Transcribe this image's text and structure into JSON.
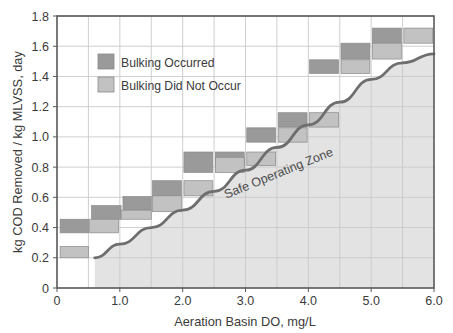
{
  "chart_data": {
    "type": "bar",
    "title": "",
    "xlabel": "Aeration Basin DO, mg/L",
    "ylabel": "kg COD Removed / kg MLVSS, day",
    "xlim": [
      0,
      6.0
    ],
    "ylim": [
      0,
      1.8
    ],
    "xticks": [
      "0",
      "1.0",
      "2.0",
      "3.0",
      "4.0",
      "5.0",
      "6.0"
    ],
    "xtick_values": [
      0,
      1.0,
      2.0,
      3.0,
      4.0,
      5.0,
      6.0
    ],
    "yticks": [
      "0",
      "0.2",
      "0.4",
      "0.6",
      "0.8",
      "1.0",
      "1.2",
      "1.4",
      "1.6",
      "1.8"
    ],
    "ytick_values": [
      0,
      0.2,
      0.4,
      0.6,
      0.8,
      1.0,
      1.2,
      1.4,
      1.6,
      1.8
    ],
    "grid": true,
    "minor_grid_x_step": 0.5,
    "legend_position": "upper-left-inside",
    "series": [
      {
        "name": "Bulking Occurred",
        "color": "#9a9a9a",
        "bars": [
          {
            "x0": 0.05,
            "x1": 0.5,
            "y0": 0.365,
            "y1": 0.455
          },
          {
            "x0": 0.55,
            "x1": 1.02,
            "y0": 0.455,
            "y1": 0.545
          },
          {
            "x0": 1.05,
            "x1": 1.5,
            "y0": 0.515,
            "y1": 0.605
          },
          {
            "x0": 1.52,
            "x1": 1.98,
            "y0": 0.61,
            "y1": 0.71
          },
          {
            "x0": 2.02,
            "x1": 2.48,
            "y0": 0.765,
            "y1": 0.9
          },
          {
            "x0": 2.52,
            "x1": 2.98,
            "y0": 0.81,
            "y1": 0.9
          },
          {
            "x0": 3.02,
            "x1": 3.48,
            "y0": 0.965,
            "y1": 1.06
          },
          {
            "x0": 3.52,
            "x1": 3.98,
            "y0": 1.065,
            "y1": 1.16
          },
          {
            "x0": 4.02,
            "x1": 4.48,
            "y0": 1.42,
            "y1": 1.51
          },
          {
            "x0": 4.52,
            "x1": 4.98,
            "y0": 1.515,
            "y1": 1.62
          },
          {
            "x0": 5.02,
            "x1": 5.48,
            "y0": 1.62,
            "y1": 1.72
          }
        ]
      },
      {
        "name": "Bulking Did Not Occur",
        "color": "#c2c2c2",
        "bars": [
          {
            "x0": 0.05,
            "x1": 0.5,
            "y0": 0.2,
            "y1": 0.275
          },
          {
            "x0": 0.52,
            "x1": 0.98,
            "y0": 0.365,
            "y1": 0.455
          },
          {
            "x0": 1.02,
            "x1": 1.5,
            "y0": 0.455,
            "y1": 0.515
          },
          {
            "x0": 1.52,
            "x1": 1.98,
            "y0": 0.505,
            "y1": 0.61
          },
          {
            "x0": 2.02,
            "x1": 2.48,
            "y0": 0.61,
            "y1": 0.71
          },
          {
            "x0": 2.52,
            "x1": 2.98,
            "y0": 0.765,
            "y1": 0.865
          },
          {
            "x0": 3.02,
            "x1": 3.48,
            "y0": 0.81,
            "y1": 0.9
          },
          {
            "x0": 3.52,
            "x1": 3.98,
            "y0": 0.965,
            "y1": 1.06
          },
          {
            "x0": 4.02,
            "x1": 4.48,
            "y0": 1.065,
            "y1": 1.16
          },
          {
            "x0": 4.52,
            "x1": 4.98,
            "y0": 1.42,
            "y1": 1.51
          },
          {
            "x0": 5.02,
            "x1": 5.48,
            "y0": 1.515,
            "y1": 1.62
          },
          {
            "x0": 5.52,
            "x1": 5.98,
            "y0": 1.62,
            "y1": 1.72
          }
        ]
      }
    ],
    "boundary_curve": {
      "name": "Safe Operating Zone boundary",
      "color": "#6e6e6e",
      "points": [
        {
          "x": 0.6,
          "y": 0.2
        },
        {
          "x": 1.0,
          "y": 0.29
        },
        {
          "x": 1.5,
          "y": 0.4
        },
        {
          "x": 2.0,
          "y": 0.515
        },
        {
          "x": 2.5,
          "y": 0.64
        },
        {
          "x": 3.0,
          "y": 0.78
        },
        {
          "x": 3.5,
          "y": 0.93
        },
        {
          "x": 4.0,
          "y": 1.08
        },
        {
          "x": 4.5,
          "y": 1.23
        },
        {
          "x": 5.0,
          "y": 1.38
        },
        {
          "x": 5.5,
          "y": 1.49
        },
        {
          "x": 6.0,
          "y": 1.55
        }
      ]
    },
    "shaded_region": {
      "label": "Safe Operating Zone",
      "color": "#e3e3e3"
    },
    "annotations": [
      {
        "text": "Safe Operating Zone",
        "x": 3.55,
        "y": 0.735,
        "rotation": -22
      }
    ]
  },
  "legend": {
    "items": [
      {
        "label": "Bulking Occurred",
        "color": "#9a9a9a"
      },
      {
        "label": "Bulking Did Not Occur",
        "color": "#c2c2c2"
      }
    ]
  },
  "axes": {
    "x_title": "Aeration Basin DO, mg/L",
    "y_title": "kg COD Removed / kg MLVSS, day"
  },
  "style": {
    "plot_border": "#595959",
    "grid_line": "#c9c9c9",
    "bar_dark": "#9a9a9a",
    "bar_light": "#c2c2c2",
    "bar_edge": "#8a8a8a",
    "zone_fill": "#e3e3e3",
    "curve": "#6e6e6e",
    "text": "#3b3b3b"
  }
}
